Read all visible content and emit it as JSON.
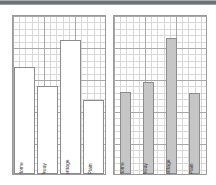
{
  "page": {
    "background_color": "#ffffff",
    "top_band_color": "#6f7275"
  },
  "chart_data": [
    {
      "type": "bar",
      "id": "left-chart",
      "title": "",
      "subtitle": "",
      "xlabel": "",
      "ylabel": "",
      "categories": [
        "Home",
        "Away",
        "Heritage",
        "Plain"
      ],
      "values": [
        68,
        56,
        85,
        47
      ],
      "ylim": [
        0,
        100
      ],
      "grid": true,
      "grid_minor": true,
      "legend": "none",
      "bar_style": "outline",
      "bar_fill_color": "#ffffff",
      "bar_edge_color": "#8d8d8d",
      "bar_width_ratio": 0.92,
      "label_rotation": -90,
      "label_position": "inside-bottom"
    },
    {
      "type": "bar",
      "id": "right-chart",
      "title": "",
      "subtitle": "",
      "xlabel": "",
      "ylabel": "",
      "categories": [
        "Home",
        "Away",
        "Heritage",
        "Plain"
      ],
      "values": [
        52,
        58,
        86,
        51
      ],
      "ylim": [
        0,
        100
      ],
      "grid": true,
      "grid_minor": true,
      "legend": "none",
      "bar_style": "filled",
      "bar_fill_color": "#c6c6c6",
      "bar_edge_color": "#8d8d8d",
      "bar_width_ratio": 0.52,
      "label_rotation": -90,
      "label_position": "inside-bottom"
    }
  ]
}
